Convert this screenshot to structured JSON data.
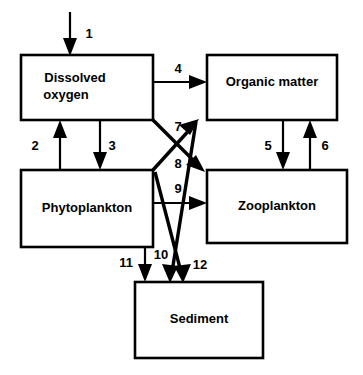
{
  "diagram": {
    "type": "flow-diagram",
    "title": "",
    "background_color": "#ffffff",
    "line_color": "#000000",
    "boxes": [
      {
        "id": "dissolved-oxygen",
        "label_line1": "Dissolved",
        "label_line2": "oxygen",
        "label": "Dissolved oxygen",
        "x": 21,
        "y": 55,
        "width": 132,
        "height": 65
      },
      {
        "id": "organic-matter",
        "label_line1": "Organic  matter",
        "label_line2": "",
        "label": "Organic matter",
        "x": 207,
        "y": 55,
        "width": 130,
        "height": 65
      },
      {
        "id": "phytoplankton",
        "label_line1": "Phytoplankton",
        "label_line2": "",
        "label": "Phytoplankton",
        "x": 21,
        "y": 170,
        "width": 132,
        "height": 77
      },
      {
        "id": "zooplankton",
        "label_line1": "Zooplankton",
        "label_line2": "",
        "label": "Zooplankton",
        "x": 207,
        "y": 170,
        "width": 140,
        "height": 73
      },
      {
        "id": "sediment",
        "label_line1": "Sediment",
        "label_line2": "",
        "label": "Sediment",
        "x": 135,
        "y": 282,
        "width": 128,
        "height": 76
      }
    ],
    "flows": [
      {
        "id": "flow-1",
        "number": "1",
        "from": "external",
        "to": "dissolved-oxygen",
        "label_x": 89,
        "label_y": 35
      },
      {
        "id": "flow-2",
        "number": "2",
        "from": "phytoplankton",
        "to": "dissolved-oxygen",
        "label_x": 35,
        "label_y": 147
      },
      {
        "id": "flow-3",
        "number": "3",
        "from": "dissolved-oxygen",
        "to": "phytoplankton",
        "label_x": 112,
        "label_y": 147
      },
      {
        "id": "flow-4",
        "number": "4",
        "from": "dissolved-oxygen",
        "to": "organic-matter",
        "label_x": 178,
        "label_y": 70
      },
      {
        "id": "flow-5",
        "number": "5",
        "from": "organic-matter",
        "to": "zooplankton",
        "label_x": 268,
        "label_y": 147
      },
      {
        "id": "flow-6",
        "number": "6",
        "from": "zooplankton",
        "to": "organic-matter",
        "label_x": 325,
        "label_y": 147
      },
      {
        "id": "flow-7",
        "number": "7",
        "from": "phytoplankton",
        "to": "organic-matter",
        "label_x": 178,
        "label_y": 128
      },
      {
        "id": "flow-8",
        "number": "8",
        "from": "dissolved-oxygen",
        "to": "zooplankton",
        "label_x": 178,
        "label_y": 165
      },
      {
        "id": "flow-9",
        "number": "9",
        "from": "phytoplankton",
        "to": "zooplankton",
        "label_x": 178,
        "label_y": 190
      },
      {
        "id": "flow-10",
        "number": "10",
        "from": "organic-matter",
        "to": "sediment",
        "label_x": 161,
        "label_y": 256
      },
      {
        "id": "flow-11",
        "number": "11",
        "from": "phytoplankton",
        "to": "sediment",
        "label_x": 126,
        "label_y": 264
      },
      {
        "id": "flow-12",
        "number": "12",
        "from": "zooplankton",
        "to": "sediment",
        "label_x": 200,
        "label_y": 266
      }
    ]
  }
}
